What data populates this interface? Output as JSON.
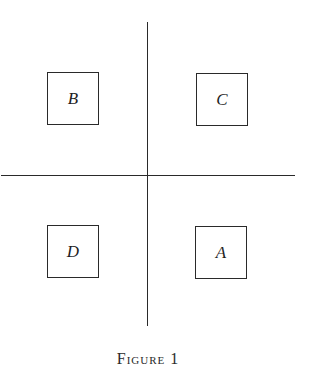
{
  "figure": {
    "caption": "Figure 1",
    "axes": {
      "vertical": {
        "x": 147,
        "y_start": 22,
        "y_end": 326
      },
      "horizontal": {
        "y": 175,
        "x_start": 1,
        "x_end": 295
      }
    },
    "boxes": [
      {
        "id": "B",
        "label": "B",
        "quadrant": "top-left"
      },
      {
        "id": "C",
        "label": "C",
        "quadrant": "top-right"
      },
      {
        "id": "D",
        "label": "D",
        "quadrant": "bottom-left"
      },
      {
        "id": "A",
        "label": "A",
        "quadrant": "bottom-right"
      }
    ],
    "colors": {
      "line": "#2a2a2a",
      "background": "#ffffff",
      "text": "#1f1f1f"
    }
  }
}
